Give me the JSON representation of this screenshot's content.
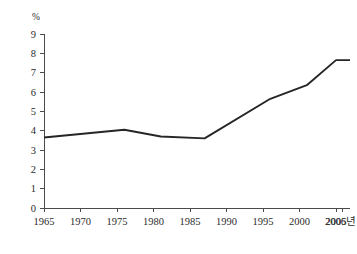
{
  "chart_data": {
    "type": "line",
    "title": "",
    "subtitle": "",
    "xlabel": "",
    "ylabel": "%",
    "unit_label": "%",
    "x_axis_end_label": "2006년",
    "xlim": [
      1963.5,
      2007.5
    ],
    "ylim": [
      0,
      9
    ],
    "grid": false,
    "legend": "none",
    "x_tick_labels": [
      "1965",
      "1970",
      "1975",
      "1980",
      "1985",
      "1990",
      "1995",
      "2000",
      "2005",
      "2006년"
    ],
    "x_tick_values": [
      1965,
      1970,
      1975,
      1980,
      1985,
      1990,
      1995,
      2000,
      2005,
      2006
    ],
    "y_tick_labels": [
      "0",
      "1",
      "2",
      "3",
      "4",
      "5",
      "6",
      "7",
      "8",
      "9"
    ],
    "y_tick_values": [
      0,
      1,
      2,
      3,
      4,
      5,
      6,
      7,
      8,
      9
    ],
    "series": [
      {
        "name": "",
        "x": [
          1965,
          1976,
          1981,
          1987,
          1996,
          2001,
          2005,
          2006
        ],
        "values": [
          3.65,
          4.05,
          3.7,
          3.6,
          5.65,
          6.35,
          7.65,
          7.65
        ]
      }
    ],
    "line_color": "#262626",
    "axis_color": "#4a4a4a",
    "background_color": "#ffffff"
  }
}
